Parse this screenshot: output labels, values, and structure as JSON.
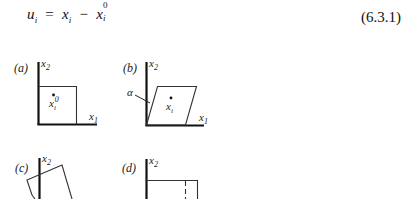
{
  "equation": {
    "lhs_symbol": "u",
    "lhs_sub": "i",
    "equals": "=",
    "term1_symbol": "x",
    "term1_sub": "i",
    "minus": "−",
    "term2_symbol": "x",
    "term2_sub": "i",
    "term2_sup": "0",
    "number": "(6.3.1)"
  },
  "figure": {
    "panels": [
      {
        "id": "a",
        "label": "(a)",
        "y_axis_label": "x",
        "y_axis_sub": "2",
        "x_axis_label": "x",
        "x_axis_sub": "1",
        "point_label": "x",
        "point_sub": "i",
        "point_sup": "0",
        "shape": "square"
      },
      {
        "id": "b",
        "label": "(b)",
        "y_axis_label": "x",
        "y_axis_sub": "2",
        "x_axis_label": "x",
        "x_axis_sub": "1",
        "point_label": "x",
        "point_sub": "i",
        "angle_label": "α",
        "shape": "sheared parallelogram"
      },
      {
        "id": "c",
        "label": "(c)",
        "y_axis_label": "x",
        "y_axis_sub": "2",
        "shape": "rotated square"
      },
      {
        "id": "d",
        "label": "(d)",
        "y_axis_label": "x",
        "y_axis_sub": "2",
        "shape": "stretched rectangle with dashed original edge"
      }
    ],
    "colors": {
      "axis": "#111111",
      "outline": "#333333"
    }
  }
}
